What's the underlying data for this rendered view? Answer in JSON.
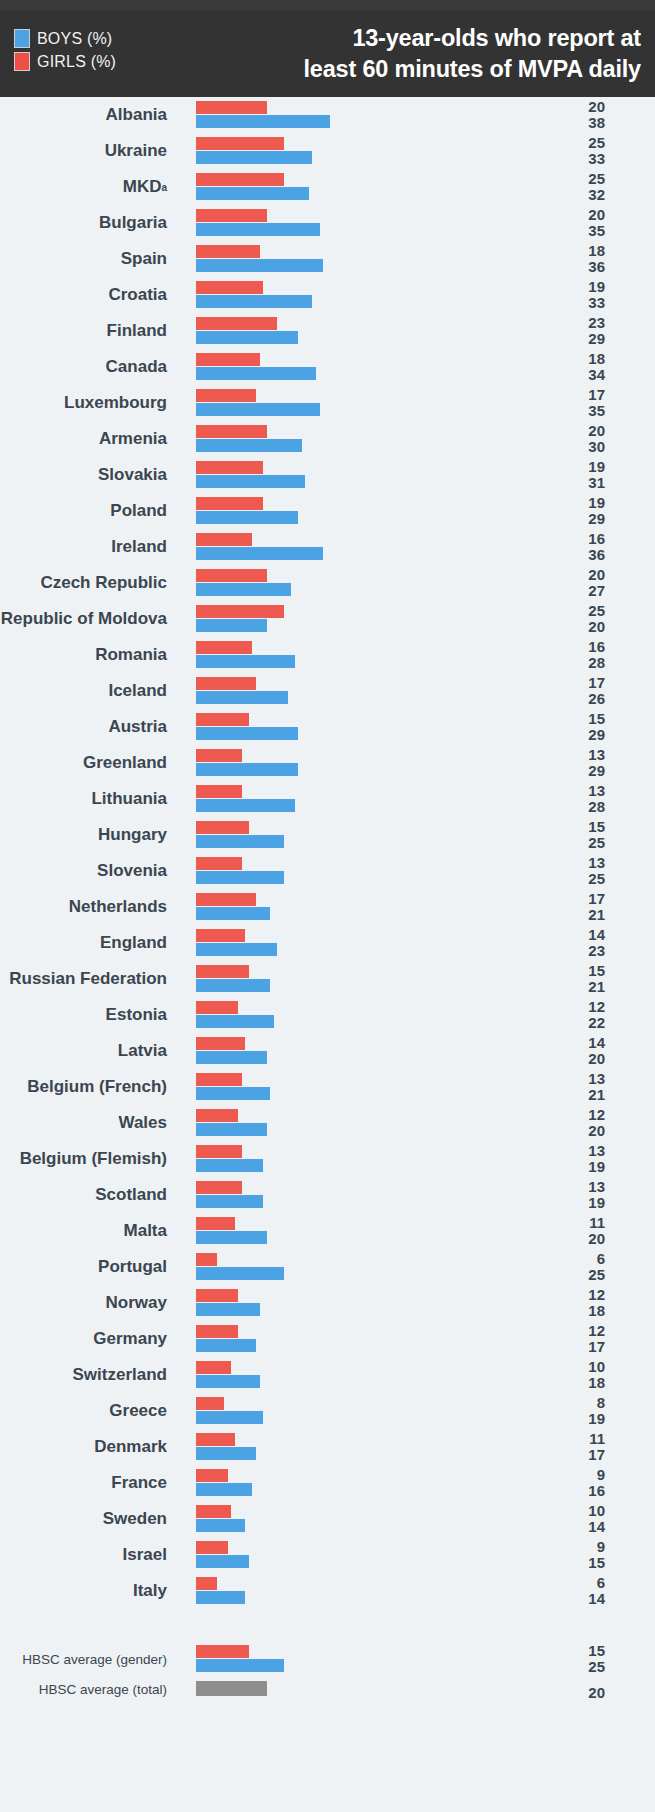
{
  "header": {
    "title_line1": "13-year-olds who report at",
    "title_line2": "least 60 minutes of MVPA daily",
    "legend": [
      {
        "key": "boys",
        "label": "BOYS (%)",
        "color": "#4ba3e3"
      },
      {
        "key": "girls",
        "label": "GIRLS (%)",
        "color": "#ef4f46"
      }
    ]
  },
  "footnote_marker": "a",
  "colors": {
    "boys": "#4ba3e3",
    "girls": "#ef5a50",
    "total": "#8e8e8e",
    "header_band": "#333333",
    "page_background": "#eef2f4",
    "text": "#3b4650"
  },
  "averages": [
    {
      "label": "HBSC average (gender)",
      "girls": 15,
      "boys": 25,
      "type": "gender"
    },
    {
      "label": "HBSC average (total)",
      "total": 20,
      "type": "total"
    }
  ],
  "chart_data": {
    "type": "bar",
    "orientation": "horizontal",
    "title": "13-year-olds who report at least 60 minutes of MVPA daily",
    "xlabel": "",
    "ylabel": "",
    "xlim": [
      0,
      40
    ],
    "grid": false,
    "legend_position": "top-left",
    "value_unit": "%",
    "legend": [
      "BOYS (%)",
      "GIRLS (%)"
    ],
    "categories": [
      "Albania",
      "Ukraine",
      "MKD",
      "Bulgaria",
      "Spain",
      "Croatia",
      "Finland",
      "Canada",
      "Luxembourg",
      "Armenia",
      "Slovakia",
      "Poland",
      "Ireland",
      "Czech Republic",
      "Republic of Moldova",
      "Romania",
      "Iceland",
      "Austria",
      "Greenland",
      "Lithuania",
      "Hungary",
      "Slovenia",
      "Netherlands",
      "England",
      "Russian Federation",
      "Estonia",
      "Latvia",
      "Belgium (French)",
      "Wales",
      "Belgium (Flemish)",
      "Scotland",
      "Malta",
      "Portugal",
      "Norway",
      "Germany",
      "Switzerland",
      "Greece",
      "Denmark",
      "France",
      "Sweden",
      "Israel",
      "Italy"
    ],
    "series": [
      {
        "name": "GIRLS (%)",
        "color": "#ef5a50",
        "values": [
          20,
          25,
          25,
          20,
          18,
          19,
          23,
          18,
          17,
          20,
          19,
          19,
          16,
          20,
          25,
          16,
          17,
          15,
          13,
          13,
          15,
          13,
          17,
          14,
          15,
          12,
          14,
          13,
          12,
          13,
          13,
          11,
          6,
          12,
          12,
          10,
          8,
          11,
          9,
          10,
          9,
          6
        ]
      },
      {
        "name": "BOYS (%)",
        "color": "#4ba3e3",
        "values": [
          38,
          33,
          32,
          35,
          36,
          33,
          29,
          34,
          35,
          30,
          31,
          29,
          36,
          27,
          20,
          28,
          26,
          29,
          29,
          28,
          25,
          25,
          21,
          23,
          21,
          22,
          20,
          21,
          20,
          19,
          19,
          20,
          25,
          18,
          17,
          18,
          19,
          17,
          16,
          14,
          15,
          14
        ]
      }
    ],
    "averages": {
      "gender": {
        "girls": 15,
        "boys": 25
      },
      "total": 20
    }
  },
  "rows": [
    {
      "label": "Albania",
      "sup": "",
      "girls": 20,
      "boys": 38
    },
    {
      "label": "Ukraine",
      "sup": "",
      "girls": 25,
      "boys": 33
    },
    {
      "label": "MKD",
      "sup": "a",
      "girls": 25,
      "boys": 32
    },
    {
      "label": "Bulgaria",
      "sup": "",
      "girls": 20,
      "boys": 35
    },
    {
      "label": "Spain",
      "sup": "",
      "girls": 18,
      "boys": 36
    },
    {
      "label": "Croatia",
      "sup": "",
      "girls": 19,
      "boys": 33
    },
    {
      "label": "Finland",
      "sup": "",
      "girls": 23,
      "boys": 29
    },
    {
      "label": "Canada",
      "sup": "",
      "girls": 18,
      "boys": 34
    },
    {
      "label": "Luxembourg",
      "sup": "",
      "girls": 17,
      "boys": 35
    },
    {
      "label": "Armenia",
      "sup": "",
      "girls": 20,
      "boys": 30
    },
    {
      "label": "Slovakia",
      "sup": "",
      "girls": 19,
      "boys": 31
    },
    {
      "label": "Poland",
      "sup": "",
      "girls": 19,
      "boys": 29
    },
    {
      "label": "Ireland",
      "sup": "",
      "girls": 16,
      "boys": 36
    },
    {
      "label": "Czech Republic",
      "sup": "",
      "girls": 20,
      "boys": 27
    },
    {
      "label": "Republic of Moldova",
      "sup": "",
      "girls": 25,
      "boys": 20
    },
    {
      "label": "Romania",
      "sup": "",
      "girls": 16,
      "boys": 28
    },
    {
      "label": "Iceland",
      "sup": "",
      "girls": 17,
      "boys": 26
    },
    {
      "label": "Austria",
      "sup": "",
      "girls": 15,
      "boys": 29
    },
    {
      "label": "Greenland",
      "sup": "",
      "girls": 13,
      "boys": 29
    },
    {
      "label": "Lithuania",
      "sup": "",
      "girls": 13,
      "boys": 28
    },
    {
      "label": "Hungary",
      "sup": "",
      "girls": 15,
      "boys": 25
    },
    {
      "label": "Slovenia",
      "sup": "",
      "girls": 13,
      "boys": 25
    },
    {
      "label": "Netherlands",
      "sup": "",
      "girls": 17,
      "boys": 21
    },
    {
      "label": "England",
      "sup": "",
      "girls": 14,
      "boys": 23
    },
    {
      "label": "Russian Federation",
      "sup": "",
      "girls": 15,
      "boys": 21
    },
    {
      "label": "Estonia",
      "sup": "",
      "girls": 12,
      "boys": 22
    },
    {
      "label": "Latvia",
      "sup": "",
      "girls": 14,
      "boys": 20
    },
    {
      "label": "Belgium (French)",
      "sup": "",
      "girls": 13,
      "boys": 21
    },
    {
      "label": "Wales",
      "sup": "",
      "girls": 12,
      "boys": 20
    },
    {
      "label": "Belgium (Flemish)",
      "sup": "",
      "girls": 13,
      "boys": 19
    },
    {
      "label": "Scotland",
      "sup": "",
      "girls": 13,
      "boys": 19
    },
    {
      "label": "Malta",
      "sup": "",
      "girls": 11,
      "boys": 20
    },
    {
      "label": "Portugal",
      "sup": "",
      "girls": 6,
      "boys": 25
    },
    {
      "label": "Norway",
      "sup": "",
      "girls": 12,
      "boys": 18
    },
    {
      "label": "Germany",
      "sup": "",
      "girls": 12,
      "boys": 17
    },
    {
      "label": "Switzerland",
      "sup": "",
      "girls": 10,
      "boys": 18
    },
    {
      "label": "Greece",
      "sup": "",
      "girls": 8,
      "boys": 19
    },
    {
      "label": "Denmark",
      "sup": "",
      "girls": 11,
      "boys": 17
    },
    {
      "label": "France",
      "sup": "",
      "girls": 9,
      "boys": 16
    },
    {
      "label": "Sweden",
      "sup": "",
      "girls": 10,
      "boys": 14
    },
    {
      "label": "Israel",
      "sup": "",
      "girls": 9,
      "boys": 15
    },
    {
      "label": "Italy",
      "sup": "",
      "girls": 6,
      "boys": 14
    }
  ]
}
